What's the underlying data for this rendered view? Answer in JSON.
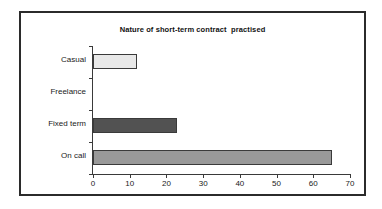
{
  "chart_data": {
    "type": "bar",
    "orientation": "horizontal",
    "title": "Nature of short-term contract  practised",
    "xlabel": "",
    "ylabel": "",
    "categories": [
      "Casual",
      "Freelance",
      "Fixed term",
      "On call"
    ],
    "values": [
      12,
      0,
      23,
      65
    ],
    "bar_colors": [
      "#e8e8e8",
      "#e8e8e8",
      "#525252",
      "#999999"
    ],
    "bar_border_color": "#3a3a3a",
    "xlim": [
      0,
      70
    ],
    "xticks": [
      0,
      10,
      20,
      30,
      40,
      50,
      60,
      70
    ],
    "xtick_labels": [
      "0",
      "10",
      "20",
      "30",
      "40",
      "50",
      "60",
      "70"
    ],
    "grid": false,
    "legend": false,
    "axis_color": "#3a3a3a",
    "frame_color": "#2b2b2b",
    "background": "#ffffff"
  }
}
